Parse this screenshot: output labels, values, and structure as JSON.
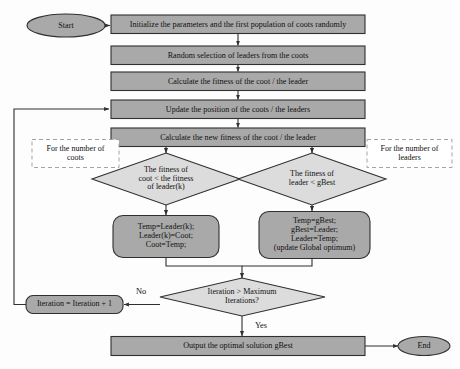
{
  "diagram": {
    "type": "flowchart",
    "canvas": {
      "width": 460,
      "height": 369
    },
    "colors": {
      "process_fill": "#a9a9a9",
      "decision_fill": "#dcdcdc",
      "terminator_fill": "#a9a9a9",
      "rounded_fill": "#a9a9a9",
      "note_fill": "#ffffff",
      "stroke": "#303030",
      "note_stroke": "#9a9a9a",
      "text": "#101010",
      "background": "#fdfdfd"
    }
  },
  "nodes": {
    "start": {
      "label": "Start",
      "shape": "ellipse"
    },
    "end": {
      "label": "End",
      "shape": "ellipse"
    },
    "init": {
      "label": "Initialize the parameters and the first population of coots randomly",
      "shape": "rectangle"
    },
    "select_leaders": {
      "label": "Random selection of leaders from the coots",
      "shape": "rectangle"
    },
    "calc_fitness": {
      "label": "Calculate the fitness of the coot / the leader",
      "shape": "rectangle"
    },
    "update_position": {
      "label": "Update the position of the coots / the leaders",
      "shape": "rectangle"
    },
    "calc_new_fitness": {
      "label": "Calculate the new fitness of the coot / the leader",
      "shape": "rectangle"
    },
    "decide_coot": {
      "label": "The fitness of\ncoot < the fitness\nof leader(k)",
      "shape": "diamond"
    },
    "decide_leader": {
      "label": "The fitness of\nleader < gBest",
      "shape": "diamond"
    },
    "swap_coot": {
      "label": "Temp=Leader(k);\nLeader(k)=Coot;\nCoot=Temp;",
      "shape": "rounded-rectangle"
    },
    "swap_leader": {
      "label": "Temp=gBest;\ngBest=Leader;\nLeader=Temp;\n(update Global optimum)",
      "shape": "rounded-rectangle"
    },
    "decide_iteration": {
      "label": "Iteration > Maximum\nIterations?",
      "shape": "diamond"
    },
    "increment": {
      "label": "Iteration = Iteration + 1",
      "shape": "rounded-rectangle"
    },
    "output": {
      "label": "Output the optimal solution gBest",
      "shape": "rectangle"
    }
  },
  "notes": {
    "coots_loop": {
      "label": "For the number of\ncoots",
      "style": "dashed"
    },
    "leaders_loop": {
      "label": "For the number of\nleaders",
      "style": "dashed"
    }
  },
  "edge_labels": {
    "no": "No",
    "yes": "Yes"
  }
}
